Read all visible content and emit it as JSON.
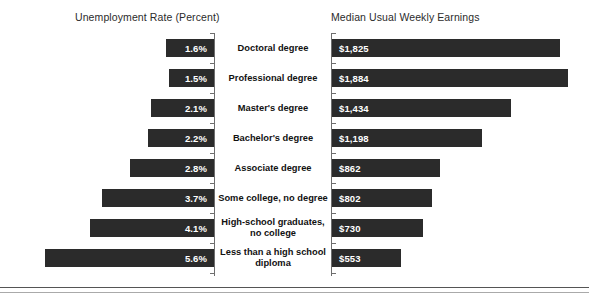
{
  "headers": {
    "left": "Unemployment Rate (Percent)",
    "right": "Median Usual Weekly Earnings"
  },
  "chart_data": {
    "type": "bar",
    "orientation": "horizontal",
    "layout": "diverging-paired",
    "title": "",
    "categories": [
      "Doctoral degree",
      "Professional degree",
      "Master's degree",
      "Bachelor's degree",
      "Associate degree",
      "Some college, no degree",
      "High-school graduates, no college",
      "Less than a high school diploma"
    ],
    "series": [
      {
        "name": "Unemployment Rate (Percent)",
        "side": "left",
        "values": [
          1.6,
          1.5,
          2.1,
          2.2,
          2.8,
          3.7,
          4.1,
          5.6
        ],
        "labels": [
          "1.6%",
          "1.5%",
          "2.1%",
          "2.2%",
          "2.8%",
          "3.7%",
          "4.1%",
          "5.6%"
        ],
        "unit": "percent",
        "axis_max": 6.0
      },
      {
        "name": "Median Usual Weekly Earnings",
        "side": "right",
        "values": [
          1825,
          1884,
          1434,
          1198,
          862,
          802,
          730,
          553
        ],
        "labels": [
          "$1,825",
          "$1,884",
          "$1,434",
          "$1,198",
          "$862",
          "$802",
          "$730",
          "$553"
        ],
        "unit": "usd-per-week",
        "axis_max": 2000
      }
    ],
    "xlabel": "",
    "ylabel": "",
    "grid": false,
    "legend": "none",
    "colors": {
      "bar": "#2b2b2b",
      "bar_label": "#ffffff",
      "axis": "#6e6e6e",
      "background": "#ffffff",
      "text": "#111111"
    }
  }
}
